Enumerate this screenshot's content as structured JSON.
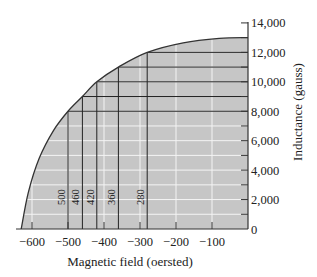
{
  "chart_data": {
    "type": "line",
    "title": "",
    "xlabel": "Magnetic field (oersted)",
    "ylabel": "Inductance (gauss)",
    "xlim": [
      -630,
      0
    ],
    "ylim": [
      0,
      14000
    ],
    "x_ticks": [
      -600,
      -500,
      -400,
      -300,
      -200,
      -100
    ],
    "x_tick_labels": [
      "−600",
      "−500",
      "−400",
      "−300",
      "−200",
      "−100"
    ],
    "y_ticks": [
      0,
      2000,
      4000,
      6000,
      8000,
      10000,
      12000,
      14000
    ],
    "y_tick_labels": [
      "0",
      "2,000",
      "4,000",
      "6,000",
      "8,000",
      "10,000",
      "12,000",
      "14,000"
    ],
    "grid": true,
    "series": [
      {
        "name": "B-H curve",
        "x": [
          -630,
          -610,
          -580,
          -540,
          -500,
          -460,
          -420,
          -360,
          -280,
          -180,
          -80,
          0
        ],
        "y": [
          0,
          2500,
          4800,
          6700,
          8000,
          9000,
          10000,
          11000,
          12000,
          12650,
          12950,
          13000
        ]
      }
    ],
    "annotations": [
      {
        "label": "500",
        "x": -500,
        "y": 8000
      },
      {
        "label": "460",
        "x": -460,
        "y": 9000
      },
      {
        "label": "420",
        "x": -420,
        "y": 10000
      },
      {
        "label": "360",
        "x": -360,
        "y": 11000
      },
      {
        "label": "280",
        "x": -280,
        "y": 12000
      }
    ]
  }
}
